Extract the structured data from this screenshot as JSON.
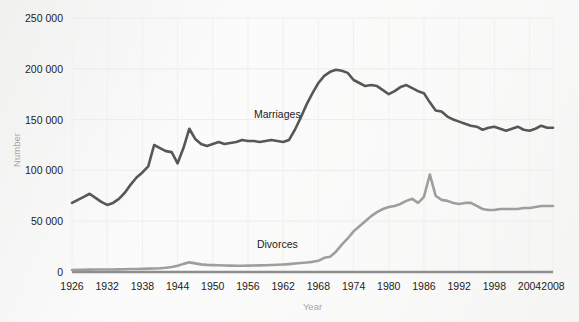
{
  "chart_data": {
    "type": "line",
    "title": "",
    "xlabel": "Year",
    "ylabel": "Number",
    "xlim": [
      1926,
      2008
    ],
    "ylim": [
      0,
      250000
    ],
    "grid": true,
    "legend_position": "inline-annotation",
    "xticks": [
      "1926",
      "1932",
      "1938",
      "1944",
      "1950",
      "1956",
      "1962",
      "1968",
      "1974",
      "1980",
      "1986",
      "1992",
      "1998",
      "2004",
      "2008"
    ],
    "yticks": [
      "0",
      "50 000",
      "100 000",
      "150 000",
      "200 000",
      "250 000"
    ],
    "ytick_values": [
      0,
      50000,
      100000,
      150000,
      200000,
      250000
    ],
    "annotations": [
      {
        "text": "Marriages",
        "x": 1961,
        "y": 152000
      },
      {
        "text": "Divorces",
        "x": 1961,
        "y": 24000
      }
    ],
    "series": [
      {
        "name": "Marriages",
        "color": "#575757",
        "width": 2.6,
        "x": [
          1926,
          1927,
          1928,
          1929,
          1930,
          1931,
          1932,
          1933,
          1934,
          1935,
          1936,
          1937,
          1938,
          1939,
          1940,
          1941,
          1942,
          1943,
          1944,
          1945,
          1946,
          1947,
          1948,
          1949,
          1950,
          1951,
          1952,
          1953,
          1954,
          1955,
          1956,
          1957,
          1958,
          1959,
          1960,
          1961,
          1962,
          1963,
          1964,
          1965,
          1966,
          1967,
          1968,
          1969,
          1970,
          1971,
          1972,
          1973,
          1974,
          1975,
          1976,
          1977,
          1978,
          1979,
          1980,
          1981,
          1982,
          1983,
          1984,
          1985,
          1986,
          1987,
          1988,
          1989,
          1990,
          1991,
          1992,
          1993,
          1994,
          1995,
          1996,
          1997,
          1998,
          1999,
          2000,
          2001,
          2002,
          2003,
          2004,
          2005,
          2006,
          2007,
          2008
        ],
        "values": [
          68000,
          71000,
          74000,
          77000,
          73000,
          69000,
          66000,
          68000,
          72000,
          78000,
          86000,
          93000,
          98000,
          104000,
          125000,
          122000,
          119000,
          118000,
          107000,
          122000,
          141000,
          131000,
          126000,
          124000,
          126000,
          128000,
          126000,
          127000,
          128000,
          130000,
          129000,
          129000,
          128000,
          129000,
          130000,
          129000,
          128000,
          130000,
          140000,
          152000,
          165000,
          176000,
          186000,
          193000,
          197000,
          199000,
          198000,
          196000,
          189000,
          186000,
          183000,
          184000,
          183000,
          179000,
          175000,
          178000,
          182000,
          184000,
          181000,
          178000,
          176000,
          167000,
          159000,
          158000,
          153000,
          150000,
          148000,
          146000,
          144000,
          143000,
          140000,
          142000,
          143000,
          141000,
          139000,
          141000,
          143000,
          140000,
          139000,
          141000,
          144000,
          142000,
          142000
        ]
      },
      {
        "name": "Divorces",
        "color": "#9e9e9e",
        "width": 2.6,
        "x": [
          1926,
          1927,
          1928,
          1929,
          1930,
          1931,
          1932,
          1933,
          1934,
          1935,
          1936,
          1937,
          1938,
          1939,
          1940,
          1941,
          1942,
          1943,
          1944,
          1945,
          1946,
          1947,
          1948,
          1949,
          1950,
          1951,
          1952,
          1953,
          1954,
          1955,
          1956,
          1957,
          1958,
          1959,
          1960,
          1961,
          1962,
          1963,
          1964,
          1965,
          1966,
          1967,
          1968,
          1969,
          1970,
          1971,
          1972,
          1973,
          1974,
          1975,
          1976,
          1977,
          1978,
          1979,
          1980,
          1981,
          1982,
          1983,
          1984,
          1985,
          1986,
          1987,
          1988,
          1989,
          1990,
          1991,
          1992,
          1993,
          1994,
          1995,
          1996,
          1997,
          1998,
          1999,
          2000,
          2001,
          2002,
          2003,
          2004,
          2005,
          2006,
          2007,
          2008
        ],
        "values": [
          2000,
          2100,
          2200,
          2300,
          2400,
          2400,
          2500,
          2500,
          2600,
          2700,
          2900,
          3000,
          3100,
          3300,
          3500,
          3700,
          4200,
          5000,
          6200,
          8000,
          9500,
          8500,
          7500,
          7000,
          6800,
          6600,
          6400,
          6300,
          6200,
          6200,
          6300,
          6400,
          6500,
          6700,
          6900,
          7100,
          7400,
          7800,
          8300,
          8800,
          9300,
          10000,
          11000,
          14000,
          15000,
          20000,
          27000,
          33000,
          40000,
          45000,
          50000,
          55000,
          59000,
          62000,
          64000,
          65000,
          67000,
          70000,
          72000,
          68000,
          74000,
          96000,
          75000,
          71000,
          70000,
          68000,
          67000,
          68000,
          68000,
          65000,
          62000,
          61000,
          61000,
          62000,
          62000,
          62000,
          62000,
          63000,
          63000,
          64000,
          65000,
          65000,
          65000
        ]
      }
    ]
  },
  "plot": {
    "left": 72,
    "right": 553,
    "top": 18,
    "bottom": 272,
    "tick_years": [
      1926,
      1932,
      1938,
      1944,
      1950,
      1956,
      1962,
      1968,
      1974,
      1980,
      1986,
      1992,
      1998,
      2004,
      2008
    ]
  }
}
